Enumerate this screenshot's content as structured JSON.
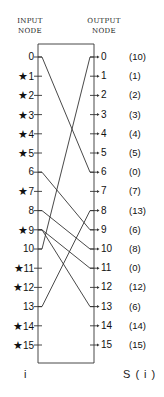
{
  "headers": {
    "input_line1": "INPUT",
    "input_line2": "NODE",
    "output_line1": "OUTPUT",
    "output_line2": "NODE"
  },
  "input_nodes": [
    {
      "label": "0",
      "star": false
    },
    {
      "label": "1",
      "star": true
    },
    {
      "label": "2",
      "star": true
    },
    {
      "label": "3",
      "star": true
    },
    {
      "label": "4",
      "star": true
    },
    {
      "label": "5",
      "star": true
    },
    {
      "label": "6",
      "star": false
    },
    {
      "label": "7",
      "star": true
    },
    {
      "label": "8",
      "star": false
    },
    {
      "label": "9",
      "star": true
    },
    {
      "label": "10",
      "star": false
    },
    {
      "label": "11",
      "star": true
    },
    {
      "label": "12",
      "star": true
    },
    {
      "label": "13",
      "star": false
    },
    {
      "label": "14",
      "star": true
    },
    {
      "label": "15",
      "star": true
    }
  ],
  "output_nodes": [
    "0",
    "1",
    "2",
    "3",
    "4",
    "5",
    "6",
    "7",
    "8",
    "9",
    "10",
    "11",
    "12",
    "13",
    "14",
    "15"
  ],
  "s_values": [
    "(10)",
    "(1)",
    "(2)",
    "(3)",
    "(4)",
    "(5)",
    "(0)",
    "(7)",
    "(13)",
    "(6)",
    "(8)",
    "(0)",
    "(12)",
    "(6)",
    "(14)",
    "(15)"
  ],
  "star_glyph": "★",
  "connections": [
    {
      "from": 0,
      "to": 6
    },
    {
      "from": 6,
      "to": 9
    },
    {
      "from": 8,
      "to": 10
    },
    {
      "from": 10,
      "to": 0
    },
    {
      "from": 13,
      "to": 8
    },
    {
      "from": 9,
      "to": 13
    },
    {
      "from": 9,
      "to": 11
    }
  ],
  "footer": {
    "left": "i",
    "right": "S ( i )"
  }
}
